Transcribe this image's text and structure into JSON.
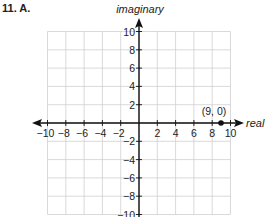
{
  "problem": {
    "label": "11. A."
  },
  "axes": {
    "x_label": "real",
    "y_label": "imaginary"
  },
  "point": {
    "label": "(9, 0)"
  },
  "colors": {
    "axis": "#111111",
    "grid": "#cfcfcf",
    "point": "#111111",
    "text": "#222222"
  },
  "chart_data": {
    "type": "scatter",
    "title": "11. A.",
    "xlabel": "real",
    "ylabel": "imaginary",
    "xlim": [
      -10,
      10
    ],
    "ylim": [
      -10,
      10
    ],
    "grid": true,
    "grid_step": 2,
    "x_ticks": [
      -10,
      -8,
      -6,
      -4,
      -2,
      2,
      4,
      6,
      8,
      10
    ],
    "y_ticks": [
      10,
      8,
      6,
      4,
      2,
      -2,
      -4,
      -6,
      -8,
      -10
    ],
    "x_tick_labels": [
      "−10",
      "−8",
      "−6",
      "−4",
      "−2",
      "2",
      "4",
      "6",
      "8",
      "10"
    ],
    "y_tick_labels": [
      "10",
      "8",
      "6",
      "4",
      "2",
      "−2",
      "−4",
      "−6",
      "−8",
      "−10"
    ],
    "series": [
      {
        "name": "point",
        "points": [
          {
            "x": 9,
            "y": 0,
            "label": "(9, 0)"
          }
        ]
      }
    ],
    "legend": null
  }
}
